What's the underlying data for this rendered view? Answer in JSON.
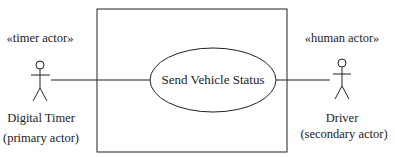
{
  "diagram": {
    "type": "UML use case diagram",
    "use_case": {
      "label": "Send Vehicle Status"
    },
    "actors": [
      {
        "stereotype": "«timer actor»",
        "name": "Digital Timer",
        "role": "(primary actor)"
      },
      {
        "stereotype": "«human actor»",
        "name": "Driver",
        "role": "(secondary actor)"
      }
    ],
    "colors": {
      "stroke": "#222222",
      "background": "#ffffff"
    }
  }
}
